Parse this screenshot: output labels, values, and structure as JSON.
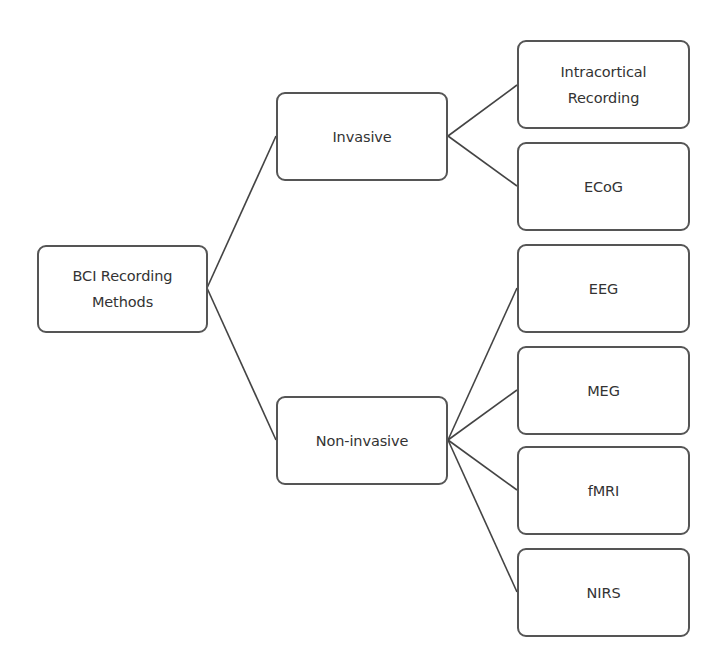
{
  "diagram": {
    "type": "tree",
    "colors": {
      "background": "#ffffff",
      "box_border": "#555555",
      "line": "#444444",
      "text": "#333333"
    },
    "root": {
      "label": "BCI Recording\nMethods"
    },
    "branches": [
      {
        "label": "Invasive",
        "children": [
          {
            "label": "Intracortical\nRecording"
          },
          {
            "label": "ECoG"
          }
        ]
      },
      {
        "label": "Non-invasive",
        "children": [
          {
            "label": "EEG"
          },
          {
            "label": "MEG"
          },
          {
            "label": "fMRI"
          },
          {
            "label": "NIRS"
          }
        ]
      }
    ]
  }
}
